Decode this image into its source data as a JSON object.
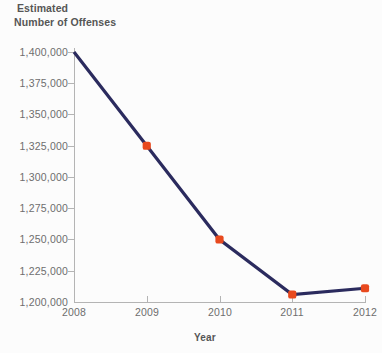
{
  "chart_data": {
    "type": "line",
    "title": "Estimated Number of Offenses",
    "title_lines": [
      "Estimated",
      "Number of Offenses"
    ],
    "xlabel": "Year",
    "ylabel": "Estimated Number of Offenses",
    "x": [
      2008,
      2009,
      2010,
      2011,
      2012
    ],
    "categories": [
      "2008",
      "2009",
      "2010",
      "2011",
      "2012"
    ],
    "values": [
      1400000,
      1325000,
      1250000,
      1206000,
      1211000
    ],
    "series": [
      {
        "name": "Estimated Number of Offenses",
        "values": [
          1400000,
          1325000,
          1250000,
          1206000,
          1211000
        ]
      }
    ],
    "ylim": [
      1200000,
      1400000
    ],
    "xlim": [
      2008,
      2012
    ],
    "ytick_values": [
      1200000,
      1225000,
      1250000,
      1275000,
      1300000,
      1325000,
      1350000,
      1375000,
      1400000
    ],
    "ytick_labels": [
      "1,200,000",
      "1,225,000",
      "1,250,000",
      "1,275,000",
      "1,300,000",
      "1,325,000",
      "1,350,000",
      "1,375,000",
      "1,400,000"
    ],
    "xtick_labels": [
      "2008",
      "2009",
      "2010",
      "2011",
      "2012"
    ],
    "grid": false,
    "legend": false,
    "legend_position": "none",
    "marker": "square",
    "markers_shown_at": [
      "2009",
      "2010",
      "2011",
      "2012"
    ],
    "line_color": "#2b2b5e",
    "marker_color": "#e8491e",
    "axis_color": "#b4b4b4",
    "tick_label_color": "#6e6e6e",
    "title_color": "#565656",
    "background_color": "#fcfcfc"
  }
}
